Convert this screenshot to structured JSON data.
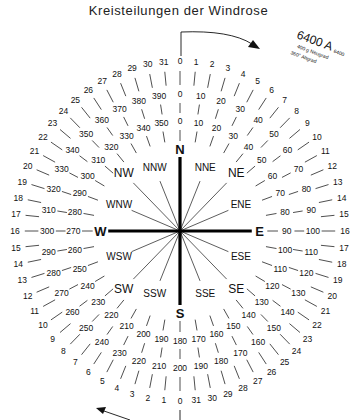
{
  "title": "Kreisteilungen der Windrose",
  "legend": {
    "main": "6400 A",
    "main_suffix": "6400",
    "line2": "400 g Neugrad",
    "line3": "360° Altgrad"
  },
  "center": {
    "x": 180,
    "y": 231
  },
  "cardinals": [
    {
      "label": "N",
      "angle": 0
    },
    {
      "label": "E",
      "angle": 90
    },
    {
      "label": "S",
      "angle": 180
    },
    {
      "label": "W",
      "angle": 270
    }
  ],
  "intercardinals": [
    {
      "label": "NE",
      "angle": 45,
      "r": 76
    },
    {
      "label": "SE",
      "angle": 135,
      "r": 76
    },
    {
      "label": "SW",
      "angle": 225,
      "r": 76
    },
    {
      "label": "NW",
      "angle": 315,
      "r": 76
    },
    {
      "label": "NNE",
      "angle": 22.5,
      "r": 62
    },
    {
      "label": "ENE",
      "angle": 67.5,
      "r": 62
    },
    {
      "label": "ESE",
      "angle": 112.5,
      "r": 62
    },
    {
      "label": "SSE",
      "angle": 157.5,
      "r": 62
    },
    {
      "label": "SSW",
      "angle": 202.5,
      "r": 62
    },
    {
      "label": "WSW",
      "angle": 247.5,
      "r": 62
    },
    {
      "label": "WNW",
      "angle": 292.5,
      "r": 62
    },
    {
      "label": "NNW",
      "angle": 337.5,
      "r": 62
    }
  ],
  "rings": {
    "outer_mils_x100": {
      "name": "6400 A",
      "right_half": [
        0,
        1,
        2,
        3,
        4,
        5,
        6,
        7,
        8,
        9,
        10,
        11,
        12,
        13,
        14,
        15,
        16,
        17,
        18,
        19,
        20,
        21,
        22,
        23,
        24,
        25,
        26,
        27,
        28,
        29,
        30,
        31
      ],
      "left_half": [
        0,
        1,
        2,
        3,
        4,
        5,
        6,
        7,
        8,
        9,
        10,
        11,
        12,
        13,
        14,
        15,
        16,
        17,
        18,
        19,
        20,
        21,
        22,
        23,
        24,
        25,
        26,
        27,
        28,
        29,
        30,
        31
      ]
    },
    "middle_grads": {
      "name": "400 g Neugrad",
      "values": [
        0,
        10,
        20,
        30,
        40,
        50,
        60,
        70,
        80,
        90,
        100,
        110,
        120,
        130,
        140,
        150,
        160,
        170,
        180,
        190,
        200,
        210,
        220,
        230,
        240,
        250,
        260,
        270,
        280,
        290,
        300,
        310,
        320,
        330,
        340,
        350,
        360,
        370,
        380,
        390
      ]
    },
    "inner_degrees": {
      "name": "360° Altgrad",
      "values": [
        0,
        10,
        20,
        30,
        40,
        50,
        60,
        70,
        80,
        90,
        100,
        110,
        120,
        130,
        140,
        150,
        160,
        170,
        180,
        190,
        200,
        210,
        220,
        230,
        240,
        250,
        260,
        270,
        280,
        290,
        300,
        310,
        320,
        330,
        340,
        350
      ]
    }
  }
}
